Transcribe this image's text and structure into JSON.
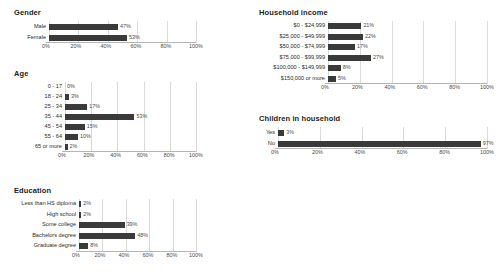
{
  "chart_data": [
    {
      "type": "bar",
      "orientation": "horizontal",
      "title": "Gender",
      "xlabel": "",
      "ylabel": "",
      "xlim": [
        0,
        100
      ],
      "ticks": [
        "0%",
        "20%",
        "40%",
        "60%",
        "80%",
        "100%"
      ],
      "tick_values": [
        0,
        20,
        40,
        60,
        80,
        100
      ],
      "grid": true,
      "legend": "none",
      "bar_color": "#3a3a3a",
      "categories": [
        "Male",
        "Female"
      ],
      "values": [
        47,
        53
      ],
      "value_labels": [
        "47%",
        "53%"
      ]
    },
    {
      "type": "bar",
      "orientation": "horizontal",
      "title": "Age",
      "xlabel": "",
      "ylabel": "",
      "xlim": [
        0,
        100
      ],
      "ticks": [
        "0%",
        "20%",
        "40%",
        "60%",
        "80%",
        "100%"
      ],
      "tick_values": [
        0,
        20,
        40,
        60,
        80,
        100
      ],
      "grid": true,
      "legend": "none",
      "bar_color": "#3a3a3a",
      "categories": [
        "0 - 17",
        "18 - 24",
        "25 - 34",
        "35 - 44",
        "45 - 54",
        "55 - 64",
        "65 or more"
      ],
      "values": [
        0,
        3,
        17,
        53,
        15,
        10,
        2
      ],
      "value_labels": [
        "0%",
        "3%",
        "17%",
        "53%",
        "15%",
        "10%",
        "2%"
      ]
    },
    {
      "type": "bar",
      "orientation": "horizontal",
      "title": "Education",
      "xlabel": "",
      "ylabel": "",
      "xlim": [
        0,
        100
      ],
      "ticks": [
        "0%",
        "20%",
        "40%",
        "60%",
        "80%",
        "100%"
      ],
      "tick_values": [
        0,
        20,
        40,
        60,
        80,
        100
      ],
      "grid": true,
      "legend": "none",
      "bar_color": "#3a3a3a",
      "categories": [
        "Less than HS diploma",
        "High school",
        "Some college",
        "Bachelors degree",
        "Graduate degree"
      ],
      "values": [
        2,
        2,
        39,
        48,
        8
      ],
      "value_labels": [
        "2%",
        "2%",
        "39%",
        "48%",
        "8%"
      ]
    },
    {
      "type": "bar",
      "orientation": "horizontal",
      "title": "Household income",
      "xlabel": "",
      "ylabel": "",
      "xlim": [
        0,
        100
      ],
      "ticks": [
        "0%",
        "20%",
        "40%",
        "60%",
        "80%",
        "100%"
      ],
      "tick_values": [
        0,
        20,
        40,
        60,
        80,
        100
      ],
      "grid": true,
      "legend": "none",
      "bar_color": "#3a3a3a",
      "categories": [
        "$0 - $24,999",
        "$25,000 - $49,999",
        "$50,000 - $74,999",
        "$75,000 - $99,999",
        "$100,000 - $149,999",
        "$150,000 or more"
      ],
      "values": [
        21,
        22,
        17,
        27,
        8,
        5
      ],
      "value_labels": [
        "21%",
        "22%",
        "17%",
        "27%",
        "8%",
        "5%"
      ]
    },
    {
      "type": "bar",
      "orientation": "horizontal",
      "title": "Children in household",
      "xlabel": "",
      "ylabel": "",
      "xlim": [
        0,
        100
      ],
      "ticks": [
        "0%",
        "20%",
        "40%",
        "60%",
        "80%",
        "100%"
      ],
      "tick_values": [
        0,
        20,
        40,
        60,
        80,
        100
      ],
      "grid": true,
      "legend": "none",
      "bar_color": "#3a3a3a",
      "categories": [
        "Yes",
        "No"
      ],
      "values": [
        3,
        97
      ],
      "value_labels": [
        "3%",
        "97%"
      ]
    }
  ]
}
